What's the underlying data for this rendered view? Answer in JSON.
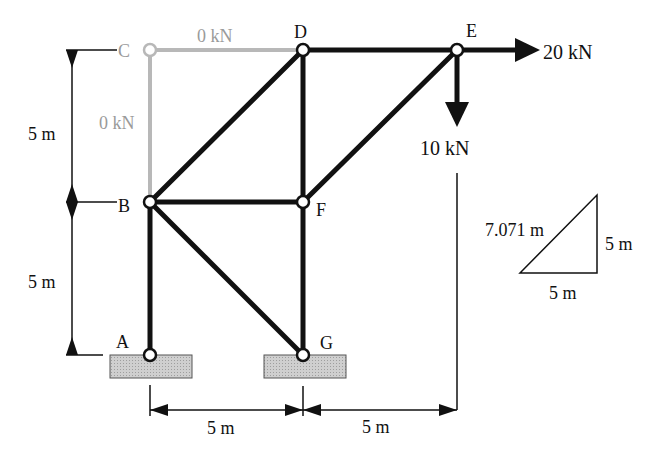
{
  "diagram": {
    "type": "truss",
    "colors": {
      "member": "#111111",
      "zero_member": "#b8b8b8",
      "support_fill": "#c8c8c8",
      "text": "#111111",
      "zero_text": "#9a9a9a"
    },
    "nodes": [
      {
        "id": "A",
        "label": "A",
        "x": 150,
        "y": 355
      },
      {
        "id": "B",
        "label": "B",
        "x": 150,
        "y": 202
      },
      {
        "id": "C",
        "label": "C",
        "x": 150,
        "y": 50
      },
      {
        "id": "D",
        "label": "D",
        "x": 303,
        "y": 50
      },
      {
        "id": "E",
        "label": "E",
        "x": 457,
        "y": 50
      },
      {
        "id": "F",
        "label": "F",
        "x": 303,
        "y": 202
      },
      {
        "id": "G",
        "label": "G",
        "x": 303,
        "y": 355
      }
    ],
    "members": [
      {
        "from": "A",
        "to": "B",
        "zero_force": false
      },
      {
        "from": "B",
        "to": "C",
        "zero_force": true,
        "force_label": "0 kN"
      },
      {
        "from": "C",
        "to": "D",
        "zero_force": true,
        "force_label": "0 kN"
      },
      {
        "from": "B",
        "to": "D",
        "zero_force": false
      },
      {
        "from": "B",
        "to": "F",
        "zero_force": false
      },
      {
        "from": "B",
        "to": "G",
        "zero_force": false
      },
      {
        "from": "D",
        "to": "F",
        "zero_force": false
      },
      {
        "from": "D",
        "to": "E",
        "zero_force": false
      },
      {
        "from": "F",
        "to": "E",
        "zero_force": false
      },
      {
        "from": "F",
        "to": "G",
        "zero_force": false
      }
    ],
    "loads": [
      {
        "node": "E",
        "direction": "right",
        "label": "20 kN"
      },
      {
        "node": "E",
        "direction": "down",
        "label": "10 kN"
      }
    ],
    "supports": [
      {
        "node": "A",
        "type": "pin"
      },
      {
        "node": "G",
        "type": "pin"
      }
    ],
    "dimensions": {
      "vertical_upper": "5 m",
      "vertical_lower": "5 m",
      "horizontal_left": "5 m",
      "horizontal_right": "5 m"
    },
    "slope_triangle": {
      "hypotenuse": "7.071 m",
      "vertical": "5 m",
      "horizontal": "5 m"
    },
    "member_labels": {
      "CD": "0 kN",
      "BC": "0 kN"
    }
  }
}
